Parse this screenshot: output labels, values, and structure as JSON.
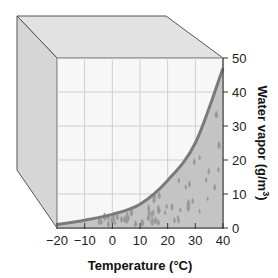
{
  "chart_data": {
    "type": "area",
    "title": "",
    "xlabel": "Temperature (°C)",
    "ylabel": "Water vapor (g/m³)",
    "ylabel_main": "Water vapor (g/m",
    "ylabel_sup": "3",
    "ylabel_end": ")",
    "x": [
      -20,
      -10,
      0,
      10,
      20,
      30,
      40
    ],
    "series": [
      {
        "name": "Saturation water vapor",
        "values": [
          1,
          2.3,
          4,
          7,
          14,
          25,
          47
        ]
      }
    ],
    "xlim": [
      -20,
      40
    ],
    "ylim": [
      0,
      50
    ],
    "x_ticks": [
      "−20",
      "−10",
      "0",
      "10",
      "20",
      "30",
      "40"
    ],
    "y_ticks": [
      "0",
      "10",
      "20",
      "30",
      "40",
      "50"
    ],
    "grid": true,
    "legend": "none",
    "decoration": "3D box with water droplets filling area under curve",
    "colors": {
      "curve": "#7a7a7a",
      "fill": "#c4c4c4",
      "droplet": "#9a9a9a",
      "box_top": "#e2e2e2",
      "box_side": "#d6d6d6",
      "plot_bg": "#f7f7f7",
      "grid": "#cfcfcf"
    }
  }
}
